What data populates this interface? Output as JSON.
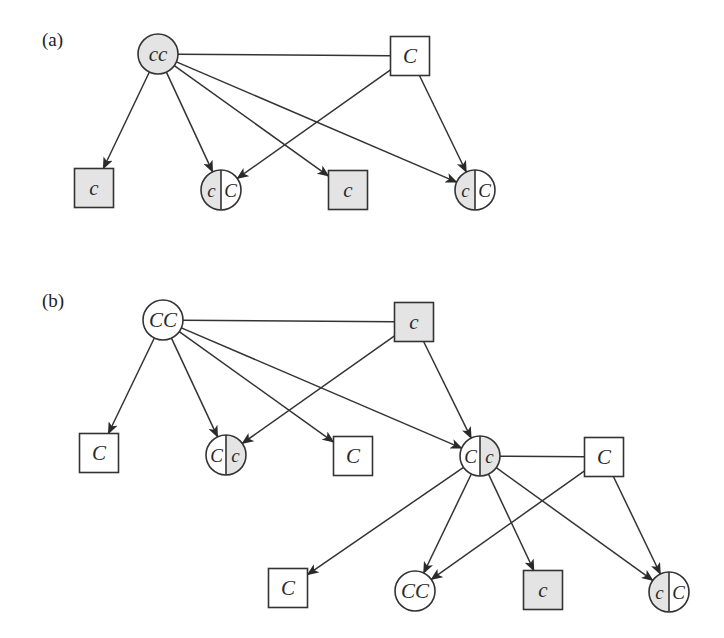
{
  "diagram": {
    "type": "pedigree",
    "colors": {
      "shaded_fill": "#e4e4e4",
      "unshaded_fill": "#ffffff",
      "line": "#333333"
    },
    "legend_notes": {
      "shaded": "recessive allele c",
      "unshaded": "dominant allele C",
      "circle": "female",
      "square": "male",
      "split": "heterozygous (half shaded)"
    },
    "panels": [
      {
        "label": "(a)",
        "nodes": [
          {
            "id": "a_mother",
            "shape": "circle",
            "genotype": "cc",
            "fill": "shaded",
            "x": 158,
            "y": 54
          },
          {
            "id": "a_father",
            "shape": "square",
            "genotype": "C",
            "fill": "unshaded",
            "x": 410,
            "y": 56
          },
          {
            "id": "a_child1",
            "shape": "square",
            "genotype": "c",
            "fill": "shaded",
            "x": 94,
            "y": 188
          },
          {
            "id": "a_child2",
            "shape": "circle",
            "genotype": "cC",
            "left": "c",
            "right": "C",
            "fill": "split-left",
            "x": 221,
            "y": 190
          },
          {
            "id": "a_child3",
            "shape": "square",
            "genotype": "c",
            "fill": "shaded",
            "x": 348,
            "y": 190
          },
          {
            "id": "a_child4",
            "shape": "circle",
            "genotype": "cC",
            "left": "c",
            "right": "C",
            "fill": "split-left",
            "x": 475,
            "y": 190
          }
        ],
        "mating_lines": [
          [
            "a_mother",
            "a_father"
          ]
        ],
        "arrows": [
          [
            "a_mother",
            "a_child1"
          ],
          [
            "a_mother",
            "a_child2"
          ],
          [
            "a_mother",
            "a_child3"
          ],
          [
            "a_mother",
            "a_child4"
          ],
          [
            "a_father",
            "a_child2"
          ],
          [
            "a_father",
            "a_child4"
          ]
        ]
      },
      {
        "label": "(b)",
        "nodes": [
          {
            "id": "b_mother",
            "shape": "circle",
            "genotype": "CC",
            "fill": "unshaded",
            "x": 163,
            "y": 320
          },
          {
            "id": "b_father",
            "shape": "square",
            "genotype": "c",
            "fill": "shaded",
            "x": 414,
            "y": 322
          },
          {
            "id": "b_child1",
            "shape": "square",
            "genotype": "C",
            "fill": "unshaded",
            "x": 99,
            "y": 453
          },
          {
            "id": "b_child2",
            "shape": "circle",
            "genotype": "Cc",
            "left": "C",
            "right": "c",
            "fill": "split-right",
            "x": 226,
            "y": 455
          },
          {
            "id": "b_child3",
            "shape": "square",
            "genotype": "C",
            "fill": "unshaded",
            "x": 353,
            "y": 456
          },
          {
            "id": "b_child4",
            "shape": "circle",
            "genotype": "Cc",
            "left": "C",
            "right": "c",
            "fill": "split-right",
            "x": 480,
            "y": 456
          },
          {
            "id": "b_mate",
            "shape": "square",
            "genotype": "C",
            "fill": "unshaded",
            "x": 604,
            "y": 457
          },
          {
            "id": "b_gchild1",
            "shape": "square",
            "genotype": "C",
            "fill": "unshaded",
            "x": 288,
            "y": 588
          },
          {
            "id": "b_gchild2",
            "shape": "circle",
            "genotype": "CC",
            "fill": "unshaded",
            "x": 415,
            "y": 591
          },
          {
            "id": "b_gchild3",
            "shape": "square",
            "genotype": "c",
            "fill": "shaded",
            "x": 543,
            "y": 590
          },
          {
            "id": "b_gchild4",
            "shape": "circle",
            "genotype": "cC",
            "left": "c",
            "right": "C",
            "fill": "split-left",
            "x": 669,
            "y": 592
          }
        ],
        "mating_lines": [
          [
            "b_mother",
            "b_father"
          ],
          [
            "b_child4",
            "b_mate"
          ]
        ],
        "arrows": [
          [
            "b_mother",
            "b_child1"
          ],
          [
            "b_mother",
            "b_child2"
          ],
          [
            "b_mother",
            "b_child3"
          ],
          [
            "b_mother",
            "b_child4"
          ],
          [
            "b_father",
            "b_child2"
          ],
          [
            "b_father",
            "b_child4"
          ],
          [
            "b_child4",
            "b_gchild1"
          ],
          [
            "b_child4",
            "b_gchild2"
          ],
          [
            "b_child4",
            "b_gchild3"
          ],
          [
            "b_child4",
            "b_gchild4"
          ],
          [
            "b_mate",
            "b_gchild2"
          ],
          [
            "b_mate",
            "b_gchild4"
          ]
        ]
      }
    ]
  }
}
